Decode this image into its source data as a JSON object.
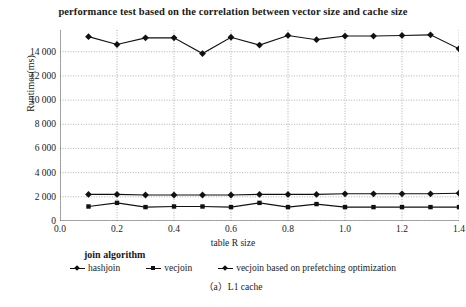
{
  "chart_data": {
    "type": "line",
    "title": "performance test based on the correlation between vector size and cache size",
    "xlabel": "table R size",
    "ylabel": "Runtimes(ms)",
    "caption": "（a）L1 cache",
    "legend_title": "join algorithm",
    "legend_position": "bottom",
    "grid": true,
    "xlim": [
      0.0,
      1.4
    ],
    "ylim": [
      0,
      15800
    ],
    "xticks": [
      "0.0",
      "0.2",
      "0.4",
      "0.6",
      "0.8",
      "1.0",
      "1.2",
      "1.4"
    ],
    "xtick_values": [
      0.0,
      0.2,
      0.4,
      0.6,
      0.8,
      1.0,
      1.2,
      1.4
    ],
    "yticks": [
      "0",
      "2 000",
      "4 000",
      "6 000",
      "8 000",
      "10 000",
      "12 000",
      "14 000"
    ],
    "ytick_values": [
      0,
      2000,
      4000,
      6000,
      8000,
      10000,
      12000,
      14000
    ],
    "x": [
      0.1,
      0.2,
      0.3,
      0.4,
      0.5,
      0.6,
      0.7,
      0.8,
      0.9,
      1.0,
      1.1,
      1.2,
      1.3,
      1.4
    ],
    "series": [
      {
        "name": "vecjoin based on prefetching optimization",
        "marker": "diamond",
        "color": "#111111",
        "values": [
          15250,
          14600,
          15150,
          15150,
          13850,
          15200,
          14550,
          15350,
          15000,
          15300,
          15300,
          15350,
          15400,
          14250
        ]
      },
      {
        "name": "hashjoin",
        "marker": "diamond",
        "color": "#111111",
        "values": [
          2200,
          2200,
          2150,
          2150,
          2150,
          2150,
          2200,
          2200,
          2200,
          2250,
          2250,
          2250,
          2250,
          2300
        ]
      },
      {
        "name": "vecjoin",
        "marker": "square",
        "color": "#111111",
        "values": [
          1200,
          1500,
          1150,
          1200,
          1200,
          1150,
          1500,
          1150,
          1400,
          1150,
          1150,
          1150,
          1150,
          1150
        ]
      }
    ],
    "legend_entries": [
      {
        "label": "hashjoin",
        "marker": "diamond"
      },
      {
        "label": "vecjoin",
        "marker": "square"
      },
      {
        "label": "vecjoin based on prefetching optimization",
        "marker": "diamond"
      }
    ]
  }
}
